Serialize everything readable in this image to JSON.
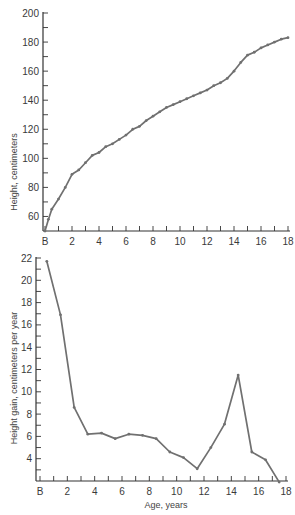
{
  "chart_data": [
    {
      "type": "line",
      "title": "",
      "xlabel": "",
      "ylabel": "Height, centimeters",
      "xlim": [
        0,
        18
      ],
      "ylim": [
        50,
        200
      ],
      "x_tick_labels": [
        "B",
        "2",
        "4",
        "6",
        "8",
        "10",
        "12",
        "14",
        "16",
        "18"
      ],
      "y_tick_labels": [
        "60",
        "80",
        "100",
        "120",
        "140",
        "160",
        "180",
        "200"
      ],
      "grid": false,
      "series": [
        {
          "name": "Height",
          "x": [
            0,
            0.25,
            0.5,
            1,
            1.5,
            2,
            2.5,
            3,
            3.5,
            4,
            4.5,
            5,
            5.5,
            6,
            6.5,
            7,
            7.5,
            8,
            8.5,
            9,
            9.5,
            10,
            10.5,
            11,
            11.5,
            12,
            12.5,
            13,
            13.5,
            14,
            14.5,
            15,
            15.5,
            16,
            16.5,
            17,
            17.5,
            18
          ],
          "values": [
            50,
            58,
            65,
            72,
            80,
            89,
            92,
            97,
            102,
            104,
            108,
            110,
            113,
            116,
            120,
            122,
            126,
            129,
            132,
            135,
            137,
            139,
            141,
            143,
            145,
            147,
            150,
            152,
            155,
            160,
            166,
            171,
            173,
            176,
            178,
            180,
            182,
            183
          ]
        }
      ]
    },
    {
      "type": "line",
      "title": "",
      "xlabel": "Age, years",
      "ylabel": "Height gain, centimeters per year",
      "xlim": [
        0,
        18
      ],
      "ylim": [
        2,
        22
      ],
      "x_tick_labels": [
        "B",
        "2",
        "4",
        "6",
        "8",
        "10",
        "12",
        "14",
        "16",
        "18"
      ],
      "y_tick_labels": [
        "4",
        "6",
        "8",
        "10",
        "12",
        "14",
        "16",
        "18",
        "20",
        "22"
      ],
      "grid": false,
      "series": [
        {
          "name": "Height gain",
          "x": [
            0.5,
            1.5,
            2.5,
            3.5,
            4.5,
            5.5,
            6.5,
            7.5,
            8.5,
            9.5,
            10.5,
            11.5,
            12.5,
            13.5,
            14.5,
            15.5,
            16.5,
            17.5
          ],
          "values": [
            21.7,
            16.9,
            8.6,
            6.2,
            6.3,
            5.8,
            6.2,
            6.1,
            5.8,
            4.6,
            4.1,
            3.1,
            5.0,
            7.1,
            11.5,
            4.6,
            3.9,
            1.9
          ]
        }
      ]
    }
  ]
}
